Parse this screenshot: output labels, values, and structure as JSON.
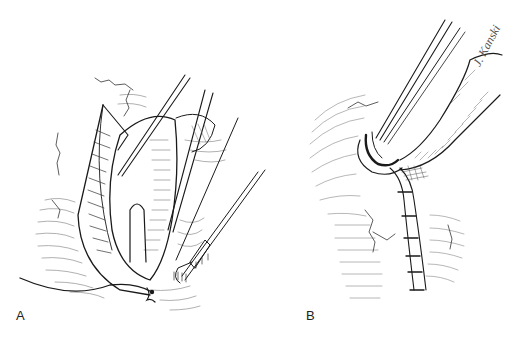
{
  "figure": {
    "panels": [
      {
        "id": "A",
        "label": "A",
        "description": "Surgical illustration: retracted tissue flap with forceps and suture needle holder"
      },
      {
        "id": "B",
        "label": "B",
        "description": "Surgical illustration: forceps at closure site with interrupted suture line"
      }
    ],
    "signature": "J. Kanski"
  },
  "colors": {
    "background": "#ffffff",
    "ink": "#1a1a1a",
    "hatch": "#6a6a6a"
  }
}
